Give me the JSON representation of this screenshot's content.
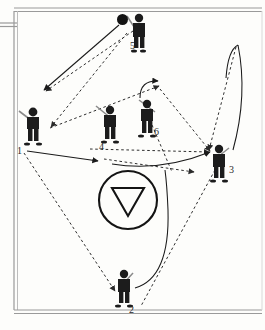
{
  "diagram": {
    "sport_surface": "field",
    "background_color": "#fdfdfb",
    "line_color": "#1a1a1a",
    "jersey_color": "#1c1c1c",
    "border": {
      "style": "double-line rectangle",
      "color": "#8e8e8e",
      "left_sideline_stub": true
    },
    "goal_marker": {
      "name": "goal-circle",
      "shape": "circle with inverted triangle",
      "cx": 128,
      "cy": 200,
      "r": 29,
      "stroke_color": "#141414"
    },
    "ball": {
      "name": "ball",
      "x": 117,
      "y": 14,
      "color": "#131313"
    },
    "players": [
      {
        "id": "p1",
        "label": "1",
        "x": 22,
        "y": 108,
        "label_x": 17,
        "label_y": 146,
        "has_stick": true,
        "has_ball": false
      },
      {
        "id": "p2",
        "label": "2",
        "x": 114,
        "y": 271,
        "label_x": 129,
        "label_y": 310,
        "has_stick": true,
        "has_ball": false
      },
      {
        "id": "p3",
        "label": "3",
        "x": 209,
        "y": 146,
        "label_x": 229,
        "label_y": 169,
        "has_stick": true,
        "has_ball": false
      },
      {
        "id": "p4",
        "label": "4",
        "x": 98,
        "y": 108,
        "label_x": 96,
        "label_y": 146,
        "has_stick": true,
        "has_ball": false
      },
      {
        "id": "p5",
        "label": "5",
        "x": 130,
        "y": 13,
        "label_x": 128,
        "label_y": 47,
        "has_stick": true,
        "has_ball": true
      },
      {
        "id": "p6",
        "label": "6",
        "x": 138,
        "y": 104,
        "label_x": 153,
        "label_y": 134,
        "has_stick": true,
        "has_ball": false
      }
    ],
    "pass_lines": [
      {
        "name": "pass-5-to-1",
        "type": "dashed",
        "points": "132,30 46,93",
        "arrow_at_end": true
      },
      {
        "name": "pass-5-to-4",
        "type": "dashed",
        "points": "128,32 50,128",
        "arrow_at_end": true
      },
      {
        "name": "pass-1-to-3",
        "type": "dashed",
        "points": "48,128 160,86",
        "arrow_at_end": false
      },
      {
        "name": "pass-4-to-3",
        "type": "dashed",
        "points": "90,148 212,152",
        "arrow_at_end": true
      },
      {
        "name": "pass-6-up",
        "type": "dashed",
        "points": "161,88 213,152",
        "arrow_at_end": true
      },
      {
        "name": "pass-3-diag",
        "type": "dashed",
        "points": "236,46 208,150",
        "arrow_at_end": true
      },
      {
        "name": "pass-3-to-2",
        "type": "dashed",
        "points": "216,168 140,305",
        "arrow_at_end": false
      },
      {
        "name": "pass-1-to-2",
        "type": "dashed",
        "points": "24,152 118,290",
        "arrow_at_end": true
      },
      {
        "name": "pass-mid-right",
        "type": "dashed",
        "points": "103,158 197,172",
        "arrow_at_end": true
      }
    ],
    "run_lines": [
      {
        "name": "run-5-to-left",
        "type": "solid",
        "points": "118,24 44,91",
        "arrow_at_end": true
      },
      {
        "name": "run-1-to-right",
        "type": "solid",
        "points": "26,150 100,160",
        "arrow_at_end": true
      },
      {
        "name": "run-mid-to-3",
        "type": "solid",
        "points": "110,163 212,152",
        "arrow_at_end": true
      },
      {
        "name": "run-6-curve",
        "type": "curve",
        "arrow_at_end": true
      },
      {
        "name": "run-3-curve",
        "type": "curve",
        "arrow_at_end": true
      },
      {
        "name": "run-2-curve",
        "type": "curve",
        "arrow_at_end": false
      }
    ],
    "legend": {
      "solid_meaning": "player run",
      "dashed_meaning": "ball pass"
    }
  }
}
